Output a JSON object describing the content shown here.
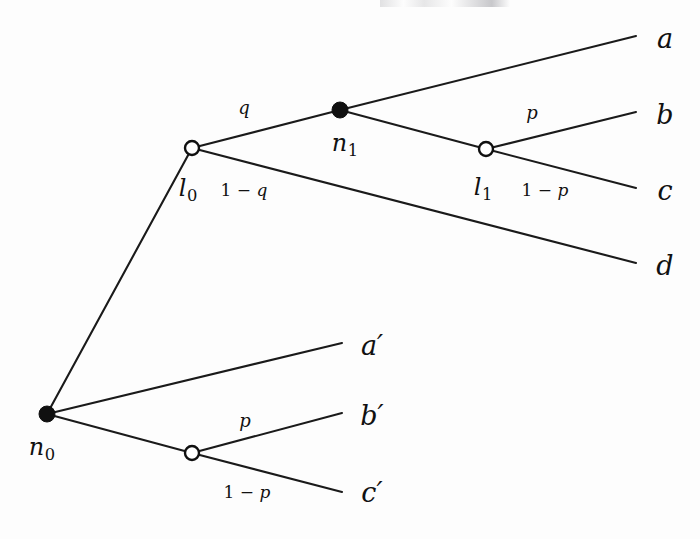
{
  "figure": {
    "type": "decision-tree",
    "background_color": "#fdfdfd",
    "ink_color": "#101010"
  },
  "nodes": [
    {
      "id": "n0",
      "label": "n",
      "subscript": "0",
      "style": "filled",
      "x": 47,
      "y": 414,
      "label_x": 42,
      "label_y": 449
    },
    {
      "id": "l0",
      "label": "l",
      "subscript": "0",
      "style": "open",
      "x": 192,
      "y": 148,
      "label_x": 188,
      "label_y": 190
    },
    {
      "id": "n1",
      "label": "n",
      "subscript": "1",
      "style": "filled",
      "x": 340,
      "y": 110,
      "label_x": 345,
      "label_y": 145
    },
    {
      "id": "l1",
      "label": "l",
      "subscript": "1",
      "style": "open",
      "x": 486,
      "y": 149,
      "label_x": 483,
      "label_y": 189
    },
    {
      "id": "chance_lower",
      "label": "",
      "subscript": "",
      "style": "open",
      "x": 192,
      "y": 453,
      "label_x": 0,
      "label_y": 0
    }
  ],
  "edges": [
    {
      "name": "n0-to-l0",
      "from": "n0",
      "to": "l0",
      "x1": 47,
      "y1": 414,
      "x2": 192,
      "y2": 148
    },
    {
      "name": "l0-to-n1",
      "from": "l0",
      "to": "n1",
      "x1": 192,
      "y1": 148,
      "x2": 340,
      "y2": 110
    },
    {
      "name": "n1-to-a",
      "from": "n1",
      "to": "a",
      "x1": 340,
      "y1": 110,
      "x2": 636,
      "y2": 36
    },
    {
      "name": "n1-to-l1",
      "from": "n1",
      "to": "l1",
      "x1": 340,
      "y1": 110,
      "x2": 486,
      "y2": 149
    },
    {
      "name": "l1-to-b",
      "from": "l1",
      "to": "b",
      "x1": 486,
      "y1": 149,
      "x2": 636,
      "y2": 112
    },
    {
      "name": "l1-to-c",
      "from": "l1",
      "to": "c",
      "x1": 486,
      "y1": 149,
      "x2": 636,
      "y2": 188
    },
    {
      "name": "l0-to-d",
      "from": "l0",
      "to": "d",
      "x1": 192,
      "y1": 148,
      "x2": 636,
      "y2": 263
    },
    {
      "name": "n0-to-aprime",
      "from": "n0",
      "to": "a_prime",
      "x1": 47,
      "y1": 414,
      "x2": 342,
      "y2": 343
    },
    {
      "name": "n0-to-chance",
      "from": "n0",
      "to": "chance_lower",
      "x1": 47,
      "y1": 414,
      "x2": 192,
      "y2": 453
    },
    {
      "name": "chance-to-bprime",
      "from": "chance_lower",
      "to": "b_prime",
      "x1": 192,
      "y1": 453,
      "x2": 342,
      "y2": 413
    },
    {
      "name": "chance-to-cprime",
      "from": "chance_lower",
      "to": "c_prime",
      "x1": 192,
      "y1": 453,
      "x2": 342,
      "y2": 492
    }
  ],
  "terminals": [
    {
      "id": "a",
      "label": "a",
      "prime": false,
      "x": 665,
      "y": 38
    },
    {
      "id": "b",
      "label": "b",
      "prime": false,
      "x": 665,
      "y": 114
    },
    {
      "id": "c",
      "label": "c",
      "prime": false,
      "x": 665,
      "y": 190
    },
    {
      "id": "d",
      "label": "d",
      "prime": false,
      "x": 665,
      "y": 265
    },
    {
      "id": "a_prime",
      "label": "a",
      "prime": true,
      "x": 372,
      "y": 345
    },
    {
      "id": "b_prime",
      "label": "b",
      "prime": true,
      "x": 372,
      "y": 415
    },
    {
      "id": "c_prime",
      "label": "c",
      "prime": true,
      "x": 372,
      "y": 492
    }
  ],
  "probabilities": [
    {
      "id": "prob-q",
      "text": "q",
      "kind": "simple",
      "edge": "l0-to-n1",
      "x": 244,
      "y": 108
    },
    {
      "id": "prob-1-minus-q",
      "text": "1 − q",
      "kind": "compound",
      "edge": "l0-to-d",
      "x": 244,
      "y": 190
    },
    {
      "id": "prob-p-upper",
      "text": "p",
      "kind": "simple",
      "edge": "l1-to-b",
      "x": 532,
      "y": 113
    },
    {
      "id": "prob-1-minus-p-upper",
      "text": "1 − p",
      "kind": "compound",
      "edge": "l1-to-c",
      "x": 545,
      "y": 190
    },
    {
      "id": "prob-p-lower",
      "text": "p",
      "kind": "simple",
      "edge": "chance-to-bprime",
      "x": 245,
      "y": 421
    },
    {
      "id": "prob-1-minus-p-lower",
      "text": "1 − p",
      "kind": "compound",
      "edge": "chance-to-cprime",
      "x": 247,
      "y": 492
    }
  ]
}
